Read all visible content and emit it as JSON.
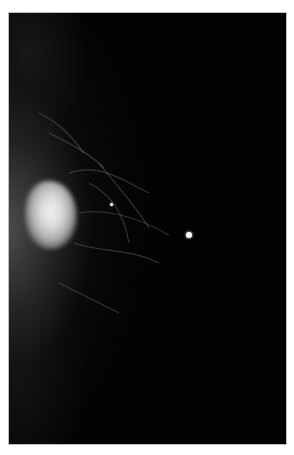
{
  "image": {
    "subject": "mammogram",
    "background_color": "#ffffff",
    "film_color": "#020202",
    "features": [
      {
        "type": "mass",
        "description": "bright dense mass at left edge",
        "x": 42,
        "y": 202
      },
      {
        "type": "calcification",
        "size": "small",
        "x": 110,
        "y": 203
      },
      {
        "type": "calcification",
        "size": "large",
        "x": 188,
        "y": 233
      }
    ]
  }
}
